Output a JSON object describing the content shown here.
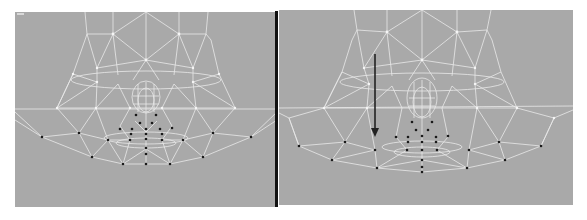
{
  "viewports": [
    {
      "id": "left",
      "label": "",
      "state": "before",
      "colors": {
        "background": "#a9a9a9",
        "wire": "#f2f2f2",
        "vertex_selected": "#1a1a1a"
      }
    },
    {
      "id": "right",
      "label": "",
      "state": "after",
      "annotation": "move-down-arrow",
      "colors": {
        "background": "#a9a9a9",
        "wire": "#f2f2f2",
        "vertex_selected": "#1a1a1a",
        "arrow": "#222222"
      }
    }
  ],
  "divider_color": "#111111"
}
